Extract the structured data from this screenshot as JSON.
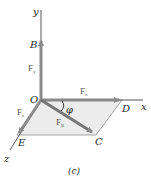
{
  "figure": {
    "caption": "(c)",
    "colors": {
      "vector": "#8a8a8a",
      "axis": "#555555",
      "plane_fill": "#ececec",
      "plane_edge": "#9a9a9a",
      "text": "#2a2a2a"
    },
    "axes": {
      "x_label": "x",
      "y_label": "y",
      "z_label": "z"
    },
    "points": {
      "origin": "O",
      "B": "B",
      "C": "C",
      "D": "D",
      "E": "E"
    },
    "vectors": {
      "Fx": {
        "symbol": "F",
        "sub": "x"
      },
      "Fy": {
        "symbol": "F",
        "sub": "y"
      },
      "Fz": {
        "symbol": "F",
        "sub": "z"
      },
      "FR": {
        "symbol": "F",
        "sub": "R"
      }
    },
    "angle": {
      "symbol": "φ"
    }
  }
}
